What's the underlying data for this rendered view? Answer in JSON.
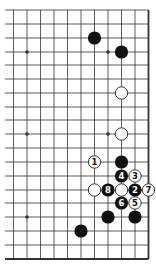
{
  "diagram": {
    "type": "go-board-partial",
    "colors": {
      "line": "#333333",
      "black_stone": "#111111",
      "white_stone": "#ffffff",
      "background": "#ffffff"
    },
    "grid": {
      "columns_x": [
        13.5,
        27,
        40.5,
        54,
        67.5,
        81,
        94.5,
        108,
        121.5,
        135,
        148.5
      ],
      "rows_y": [
        10,
        24,
        38,
        52,
        65,
        79,
        93,
        107,
        120,
        134,
        148,
        162,
        176,
        190,
        203,
        217,
        231,
        245,
        259
      ],
      "right_edge_col": 10,
      "bottom_edge_row": 18
    },
    "star_points": [
      {
        "col": 1,
        "row": 3
      },
      {
        "col": 1,
        "row": 9
      },
      {
        "col": 1,
        "row": 15
      },
      {
        "col": 7,
        "row": 3
      },
      {
        "col": 7,
        "row": 9
      }
    ],
    "stones": [
      {
        "color": "black",
        "col": 6,
        "row": 2,
        "label": ""
      },
      {
        "color": "black",
        "col": 8,
        "row": 3,
        "label": ""
      },
      {
        "color": "white",
        "col": 8,
        "row": 6,
        "label": ""
      },
      {
        "color": "white",
        "col": 8,
        "row": 9,
        "label": ""
      },
      {
        "color": "white",
        "col": 6,
        "row": 11,
        "label": "1"
      },
      {
        "color": "black",
        "col": 8,
        "row": 11,
        "label": ""
      },
      {
        "color": "black",
        "col": 8,
        "row": 12,
        "label": "4"
      },
      {
        "color": "white",
        "col": 9,
        "row": 12,
        "label": "3"
      },
      {
        "color": "white",
        "col": 6,
        "row": 13,
        "label": ""
      },
      {
        "color": "black",
        "col": 7,
        "row": 13,
        "label": "8"
      },
      {
        "color": "white",
        "col": 8,
        "row": 13,
        "label": ""
      },
      {
        "color": "black",
        "col": 9,
        "row": 13,
        "label": "2"
      },
      {
        "color": "white",
        "col": 10,
        "row": 13,
        "label": "7"
      },
      {
        "color": "black",
        "col": 8,
        "row": 14,
        "label": "6"
      },
      {
        "color": "white",
        "col": 9,
        "row": 14,
        "label": "5"
      },
      {
        "color": "black",
        "col": 7,
        "row": 15,
        "label": ""
      },
      {
        "color": "black",
        "col": 9,
        "row": 15,
        "label": ""
      },
      {
        "color": "black",
        "col": 5,
        "row": 16,
        "label": ""
      }
    ]
  }
}
